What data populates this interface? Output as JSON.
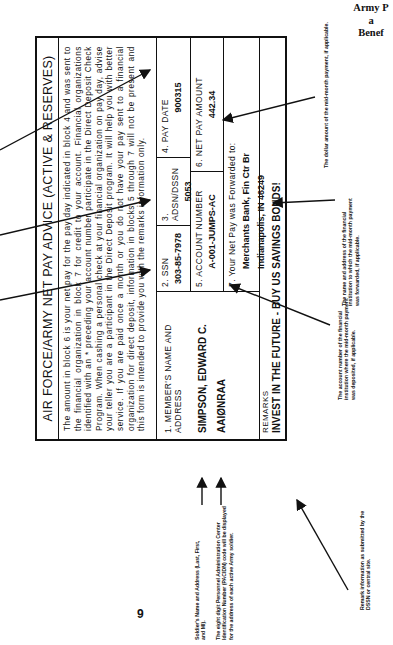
{
  "header": {
    "lines": [
      "Army P",
      "a",
      "Benef"
    ]
  },
  "form": {
    "title": "AIR FORCE/ARMY NET PAY ADVICE  (ACTIVE & RESERVES)",
    "paragraph": "The amount in block 6 is your net pay for the pay day indicated in block 4 and was sent to the financial organization in block 7 for credit to your account. Financial organizations identified with an * preceding your account number participate in the Direct Deposit Check Program. When cashing a personal check at your financial organization on pay day, advise your teller you are a participant in the Direct Deposit program. It will help you with better service. If you are paid once a month or you do not have your pay sent to a financial organization for direct deposit, information in blocks 5 through 7 will not be present and this form is intended to provide you with the remarks information only.",
    "fields": {
      "member": {
        "label": "1.  MEMBER'S NAME AND ADDRESS",
        "name": "SIMPSON, EDWARD C.",
        "code": "AAIØNRAA"
      },
      "ssn": {
        "label": "2.  SSN",
        "value": "303-85-7978"
      },
      "adsn": {
        "label": "3.  ADSN/DSSN",
        "value": "5053"
      },
      "pay_date": {
        "label": "4.  PAY DATE",
        "value": "900315"
      },
      "account": {
        "label": "5.  ACCOUNT NUMBER",
        "value": "A-001-JUMPS-AC"
      },
      "net_pay": {
        "label": "6.  NET PAY AMOUNT",
        "value": "442.34"
      },
      "forwarded": {
        "label": "7. Your Net Pay was Forwarded to:",
        "line1": "Merchants Bank, Fin Ctr Br",
        "line2": "Indianapolis, IN  46249"
      }
    },
    "remarks": {
      "label": "REMARKS",
      "value": "INVEST IN THE FUTURE - BUY US SAVINGS BONDS!"
    }
  },
  "annotations": {
    "mid_month_amount": "The dollar amount of the mid-month payment, if applicable.",
    "institution": "The name and address of the financial institution to which the mid-month payment was forwarded, if applicable.",
    "account_number": "The account number of the financial institution where the mid-month payment was deposited, if applicable.",
    "soldier_name": "Soldier's Name and Address (Last, First, and MI).",
    "pacidn": "The eight digit Personnel Administration Center Identification Number (PACIDN) code will be displayed for the address of each active Army soldier.",
    "remarks": "Remark information as submitted by the DSSN or central site."
  },
  "page_number": "9"
}
